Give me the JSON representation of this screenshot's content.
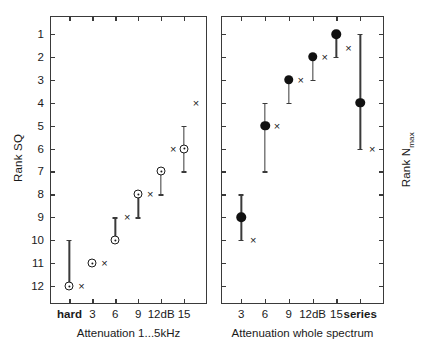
{
  "chart_data": [
    {
      "type": "scatter",
      "panel": "left",
      "title": "",
      "xlabel": "Attenuation 1...5kHz",
      "ylabel": "Rank SQ",
      "categories": [
        "hard",
        "3",
        "6",
        "9",
        "12dB",
        "15"
      ],
      "ylim": [
        1,
        12
      ],
      "y_inverted": true,
      "yticks": [
        1,
        2,
        3,
        4,
        5,
        6,
        7,
        8,
        9,
        10,
        11,
        12
      ],
      "grid": false,
      "legend": "none",
      "series": [
        {
          "name": "median-rank-open-circle",
          "marker": "open-circle",
          "values": [
            12,
            11,
            10,
            8,
            7,
            6
          ],
          "err_low": [
            10,
            11,
            9,
            9,
            8,
            7
          ],
          "err_high": [
            12,
            11,
            10,
            8,
            7,
            5
          ]
        },
        {
          "name": "secondary-cross",
          "marker": "x",
          "values": [
            12,
            11,
            9,
            8,
            6,
            4
          ]
        }
      ]
    },
    {
      "type": "scatter",
      "panel": "right",
      "title": "",
      "xlabel": "Attenuation whole spectrum",
      "ylabel": "Rank N max",
      "ylabel_base": "Rank N",
      "ylabel_sub": "max",
      "categories": [
        "3",
        "6",
        "9",
        "12dB",
        "15",
        "series"
      ],
      "ylim": [
        1,
        12
      ],
      "y_inverted": true,
      "yticks": [
        1,
        2,
        3,
        4,
        5,
        6,
        7,
        8,
        9,
        10,
        11,
        12
      ],
      "grid": false,
      "legend": "none",
      "series": [
        {
          "name": "median-rank-filled-circle",
          "marker": "filled-circle",
          "values": [
            9,
            5,
            3,
            2,
            1,
            4
          ],
          "err_low": [
            10,
            7,
            4,
            3,
            2,
            6
          ],
          "err_high": [
            8,
            4,
            3,
            2,
            1,
            1
          ]
        },
        {
          "name": "secondary-cross",
          "marker": "x",
          "values": [
            10,
            5,
            3,
            2,
            1.6,
            6
          ]
        }
      ]
    }
  ],
  "left_panel": {
    "ylabel": "Rank SQ",
    "xtitle": "Attenuation 1...5kHz",
    "ytick_labels": [
      "1",
      "2",
      "3",
      "4",
      "5",
      "6",
      "7",
      "8",
      "9",
      "10",
      "11",
      "12"
    ],
    "xtick_labels": [
      "hard",
      "3",
      "6",
      "9",
      "12dB",
      "15"
    ],
    "xtick_bold": [
      true,
      false,
      false,
      false,
      false,
      false
    ]
  },
  "right_panel": {
    "ylabel_base": "Rank N",
    "ylabel_sub": "max",
    "xtitle": "Attenuation whole spectrum",
    "xtick_labels": [
      "3",
      "6",
      "9",
      "12dB",
      "15",
      "series"
    ],
    "xtick_bold": [
      false,
      false,
      false,
      false,
      false,
      true
    ]
  }
}
